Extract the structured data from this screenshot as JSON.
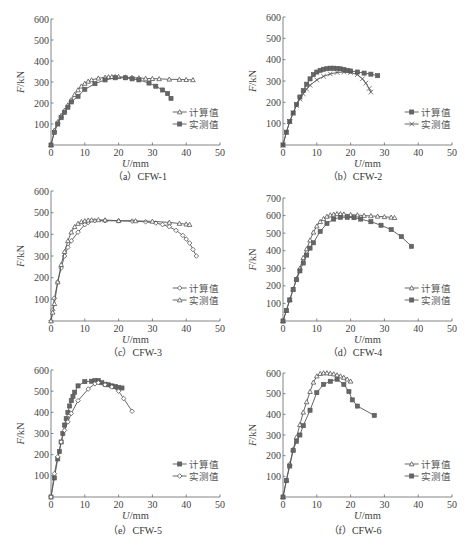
{
  "figure": {
    "series_labels": {
      "calc": "计算值",
      "meas": "实测值"
    },
    "xlabel_italic": "U",
    "xlabel_unit": "/mm",
    "ylabel_italic": "F",
    "ylabel_unit": "/kN"
  },
  "chart_data": [
    {
      "id": "a",
      "type": "line",
      "caption": "（a）CFW-1",
      "title": "CFW-1",
      "xlabel": "U/mm",
      "ylabel": "F/kN",
      "xlim": [
        0,
        50
      ],
      "ylim": [
        0,
        600
      ],
      "xticks": [
        0,
        10,
        20,
        30,
        40,
        50
      ],
      "yticks": [
        100,
        200,
        300,
        400,
        500,
        600
      ],
      "grid": false,
      "legend_position": "lower right",
      "series": [
        {
          "name": "计算值",
          "marker": "triangle",
          "x": [
            0,
            1,
            2,
            3,
            4,
            5,
            6,
            7,
            8,
            9,
            10,
            11,
            12,
            14,
            16,
            17,
            18,
            19,
            20,
            22,
            24,
            26,
            28,
            30,
            32,
            35,
            38,
            40,
            42
          ],
          "y": [
            0,
            70,
            110,
            140,
            165,
            190,
            215,
            240,
            262,
            280,
            293,
            303,
            310,
            318,
            322,
            324,
            325,
            325,
            325,
            323,
            321,
            319,
            317,
            316,
            315,
            313,
            312,
            311,
            310
          ]
        },
        {
          "name": "实测值",
          "marker": "square",
          "x": [
            0,
            1,
            2,
            3,
            4,
            5,
            6,
            8,
            10,
            13,
            16,
            19,
            22,
            24,
            26,
            29,
            31,
            33,
            34.5,
            35.5
          ],
          "y": [
            0,
            60,
            100,
            130,
            155,
            180,
            205,
            232,
            265,
            292,
            310,
            320,
            320,
            315,
            310,
            295,
            280,
            262,
            245,
            222
          ]
        }
      ]
    },
    {
      "id": "b",
      "type": "line",
      "caption": "（b）CFW-2",
      "title": "CFW-2",
      "xlabel": "U/mm",
      "ylabel": "F/kN",
      "xlim": [
        0,
        50
      ],
      "ylim": [
        0,
        600
      ],
      "xticks": [
        0,
        10,
        20,
        30,
        40,
        50
      ],
      "yticks": [
        100,
        200,
        300,
        400,
        500,
        600
      ],
      "grid": false,
      "legend_position": "lower right",
      "series": [
        {
          "name": "计算值",
          "marker": "square",
          "x": [
            0,
            1,
            2,
            3,
            4,
            5,
            6,
            7,
            8,
            9,
            10,
            11,
            12,
            13,
            14,
            15,
            16,
            17,
            18,
            19,
            20,
            22,
            24,
            26,
            28
          ],
          "y": [
            0,
            60,
            110,
            150,
            190,
            225,
            255,
            285,
            310,
            330,
            342,
            350,
            355,
            358,
            360,
            360,
            359,
            357,
            354,
            350,
            347,
            342,
            337,
            332,
            325
          ]
        },
        {
          "name": "实测值",
          "marker": "cross",
          "x": [
            0,
            1,
            2,
            3,
            4,
            5,
            6,
            7,
            8,
            10,
            12,
            14,
            16,
            18,
            20,
            22,
            23.5,
            24.5,
            25.5,
            26
          ],
          "y": [
            0,
            60,
            110,
            150,
            185,
            215,
            240,
            262,
            280,
            305,
            322,
            333,
            340,
            342,
            340,
            330,
            310,
            290,
            265,
            248
          ]
        }
      ]
    },
    {
      "id": "c",
      "type": "line",
      "caption": "（c）CFW-3",
      "title": "CFW-3",
      "xlabel": "U/mm",
      "ylabel": "F/kN",
      "xlim": [
        0,
        50
      ],
      "ylim": [
        0,
        600
      ],
      "xticks": [
        0,
        10,
        20,
        30,
        40,
        50
      ],
      "yticks": [
        100,
        200,
        300,
        400,
        500,
        600
      ],
      "grid": false,
      "legend_position": "lower right",
      "series": [
        {
          "name": "计算值",
          "marker": "diamond",
          "x": [
            0,
            0.5,
            1,
            2,
            3,
            4,
            5,
            6,
            8,
            10,
            11,
            13,
            16,
            20,
            24,
            28,
            31,
            33,
            35,
            37,
            39,
            40,
            41,
            42,
            43
          ],
          "y": [
            0,
            50,
            105,
            180,
            245,
            300,
            340,
            370,
            410,
            445,
            455,
            463,
            463,
            462,
            461,
            458,
            452,
            445,
            435,
            418,
            395,
            378,
            360,
            330,
            300
          ]
        },
        {
          "name": "实测值",
          "marker": "triangle",
          "x": [
            0,
            0.5,
            1,
            2,
            3,
            4,
            5,
            6,
            7,
            8,
            9,
            10,
            11,
            12,
            14,
            16,
            20,
            25,
            30,
            35,
            38,
            40,
            41
          ],
          "y": [
            0,
            40,
            80,
            180,
            260,
            320,
            370,
            410,
            435,
            450,
            458,
            462,
            465,
            466,
            467,
            466,
            463,
            462,
            460,
            455,
            450,
            447,
            445
          ]
        }
      ]
    },
    {
      "id": "d",
      "type": "line",
      "caption": "（d）CFW-4",
      "title": "CFW-4",
      "xlabel": "U/mm",
      "ylabel": "F/kN",
      "xlim": [
        0,
        50
      ],
      "ylim": [
        0,
        700
      ],
      "xticks": [
        0,
        10,
        20,
        30,
        40,
        50
      ],
      "yticks": [
        100,
        200,
        300,
        400,
        500,
        600,
        700
      ],
      "grid": false,
      "legend_position": "lower right",
      "series": [
        {
          "name": "计算值",
          "marker": "triangle",
          "x": [
            0,
            1,
            2,
            3,
            4,
            5,
            6,
            7,
            8,
            9,
            10,
            11,
            12,
            13,
            14,
            15,
            16,
            17,
            18,
            20,
            22,
            24,
            26,
            28,
            30,
            32,
            33
          ],
          "y": [
            0,
            60,
            120,
            180,
            240,
            300,
            360,
            410,
            460,
            505,
            540,
            565,
            582,
            595,
            603,
            607,
            610,
            610,
            608,
            605,
            603,
            600,
            598,
            596,
            593,
            590,
            588
          ]
        },
        {
          "name": "实测值",
          "marker": "square",
          "x": [
            0,
            1,
            2,
            3,
            4,
            5,
            6,
            7,
            8,
            9,
            11,
            13,
            15,
            17,
            19,
            21,
            23,
            26,
            29,
            32,
            35,
            38
          ],
          "y": [
            0,
            60,
            120,
            180,
            235,
            285,
            330,
            375,
            415,
            445,
            510,
            555,
            580,
            590,
            590,
            588,
            580,
            565,
            545,
            520,
            480,
            425
          ]
        }
      ]
    },
    {
      "id": "e",
      "type": "line",
      "caption": "（e）CFW-5",
      "title": "CFW-5",
      "xlabel": "U/mm",
      "ylabel": "F/kN",
      "xlim": [
        0,
        50
      ],
      "ylim": [
        0,
        600
      ],
      "xticks": [
        0,
        10,
        20,
        30,
        40,
        50
      ],
      "yticks": [
        100,
        200,
        300,
        400,
        500,
        600
      ],
      "grid": false,
      "legend_position": "lower right",
      "series": [
        {
          "name": "计算值",
          "marker": "square",
          "x": [
            0,
            1,
            2,
            2.5,
            3,
            3.5,
            4,
            4.5,
            5,
            5.5,
            6,
            6.5,
            7,
            8,
            10,
            12,
            13,
            14,
            15,
            16,
            17,
            18,
            19,
            20,
            21
          ],
          "y": [
            0,
            90,
            180,
            215,
            260,
            300,
            340,
            370,
            400,
            430,
            455,
            475,
            495,
            525,
            545,
            547,
            550,
            550,
            540,
            533,
            530,
            525,
            522,
            518,
            515
          ]
        },
        {
          "name": "实测值",
          "marker": "diamond",
          "x": [
            0,
            1,
            2,
            3,
            4,
            5,
            6,
            8,
            11,
            13,
            14,
            16,
            18,
            20,
            21.5,
            24
          ],
          "y": [
            0,
            110,
            190,
            260,
            315,
            355,
            395,
            455,
            510,
            535,
            540,
            530,
            520,
            500,
            465,
            405
          ]
        }
      ]
    },
    {
      "id": "f",
      "type": "line",
      "caption": "（f）CFW-6",
      "title": "CFW-6",
      "xlabel": "U/mm",
      "ylabel": "F/kN",
      "xlim": [
        0,
        50
      ],
      "ylim": [
        0,
        600
      ],
      "xticks": [
        0,
        10,
        20,
        30,
        40,
        50
      ],
      "yticks": [
        100,
        200,
        300,
        400,
        500,
        600
      ],
      "grid": false,
      "legend_position": "lower right",
      "series": [
        {
          "name": "计算值",
          "marker": "triangle",
          "x": [
            0,
            1,
            2,
            3,
            4,
            5,
            6,
            7,
            8,
            9,
            10,
            11,
            12,
            13,
            14,
            15,
            16,
            17,
            18,
            19,
            20
          ],
          "y": [
            0,
            80,
            160,
            230,
            290,
            350,
            410,
            460,
            510,
            555,
            585,
            597,
            600,
            600,
            598,
            595,
            590,
            585,
            578,
            570,
            560
          ]
        },
        {
          "name": "实测值",
          "marker": "square",
          "x": [
            0,
            1,
            2,
            3,
            4,
            5,
            6,
            8,
            10,
            12,
            14,
            16,
            18,
            19.5,
            20.5,
            22,
            27
          ],
          "y": [
            0,
            80,
            150,
            225,
            270,
            300,
            345,
            420,
            505,
            545,
            560,
            570,
            545,
            510,
            470,
            440,
            395
          ]
        }
      ]
    }
  ],
  "layout": [
    {
      "id": "a",
      "ox": 51,
      "oy": 145,
      "w": 169,
      "top": 19,
      "capx": 140,
      "capy": 180
    },
    {
      "id": "b",
      "ox": 283,
      "oy": 145,
      "w": 169,
      "top": 17,
      "capx": 355,
      "capy": 180
    },
    {
      "id": "c",
      "ox": 51,
      "oy": 321,
      "w": 169,
      "top": 191,
      "capx": 135,
      "capy": 356
    },
    {
      "id": "d",
      "ox": 283,
      "oy": 321,
      "w": 169,
      "top": 198,
      "capx": 355,
      "capy": 356
    },
    {
      "id": "e",
      "ox": 51,
      "oy": 497,
      "w": 169,
      "top": 370,
      "capx": 135,
      "capy": 534
    },
    {
      "id": "f",
      "ox": 283,
      "oy": 497,
      "w": 169,
      "top": 373,
      "capx": 355,
      "capy": 534
    }
  ]
}
